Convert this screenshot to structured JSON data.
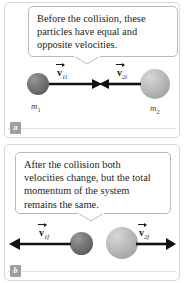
{
  "figure": {
    "panels": [
      {
        "id": "before",
        "badge": "a",
        "callout_text": "Before the collision, these particles have equal and opposite velocities.",
        "particles": [
          {
            "mass_label": "m",
            "mass_sub": "1",
            "velocity_symbol": "v",
            "velocity_sub": "1i",
            "direction": "right",
            "shade": "dark"
          },
          {
            "mass_label": "m",
            "mass_sub": "2",
            "velocity_symbol": "v",
            "velocity_sub": "2i",
            "direction": "left",
            "shade": "light"
          }
        ]
      },
      {
        "id": "after",
        "badge": "b",
        "callout_text": "After the collision both velocities change, but the total momentum of the system remains the same.",
        "particles": [
          {
            "mass_label": "",
            "mass_sub": "",
            "velocity_symbol": "v",
            "velocity_sub": "1f",
            "direction": "left",
            "shade": "dark"
          },
          {
            "mass_label": "",
            "mass_sub": "",
            "velocity_symbol": "v",
            "velocity_sub": "2f",
            "direction": "right",
            "shade": "light"
          }
        ]
      }
    ],
    "labels": {
      "v1i_sym": "v",
      "v1i_sub": "1i",
      "v2i_sym": "v",
      "v2i_sub": "2i",
      "v1f_sym": "v",
      "v1f_sub": "1f",
      "v2f_sym": "v",
      "v2f_sub": "2f",
      "m1_sym": "m",
      "m1_sub": "1",
      "m2_sym": "m",
      "m2_sub": "2"
    },
    "colors": {
      "sphere_dark": "#6e6e6e",
      "sphere_light": "#b4b4b4",
      "arrow": "#111111",
      "badge_bg": "#9f9f9f",
      "panel_border": "#d8d8d8",
      "callout_border": "#b9b9b9",
      "text": "#231f20"
    }
  }
}
